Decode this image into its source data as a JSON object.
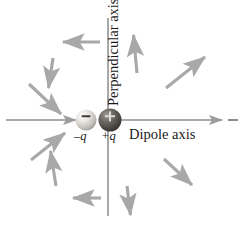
{
  "figure": {
    "width": 241,
    "height": 230,
    "background": "#ffffff"
  },
  "labels": {
    "dipole_axis": "Dipole axis",
    "perpendicular_axis": "Perpendicular axis",
    "negative_charge": "–q",
    "positive_charge": "+q",
    "negative_sign_glyph": "–",
    "positive_sign_glyph": "+"
  },
  "colors": {
    "axis_line": "#8c8c8c",
    "arrow": "#a8a8a8",
    "text": "#1a1a1a",
    "negative_sphere_light": "#f2f0ee",
    "negative_sphere_mid": "#c9c5c1",
    "negative_sphere_dark": "#9a9590",
    "positive_sphere_light": "#8d8983",
    "positive_sphere_mid": "#5c5853",
    "positive_sphere_dark": "#3a3733",
    "sign_on_sphere": "#2b2b2b"
  },
  "charges": [
    {
      "name": "negative-charge",
      "sign": "–",
      "label": "–q",
      "cx": 86,
      "cy": 120,
      "r": 10.5,
      "shade": "light"
    },
    {
      "name": "positive-charge",
      "sign": "+",
      "label": "+q",
      "cx": 110,
      "cy": 120,
      "r": 11.5,
      "shade": "dark"
    }
  ],
  "axes": [
    {
      "name": "dipole-axis",
      "orientation": "horizontal",
      "x1": 6,
      "y1": 120,
      "x2": 236,
      "y2": 120,
      "arrow_right_at_x": 218,
      "arrow_right_toward_center_at_x": 72
    },
    {
      "name": "perpendicular-axis",
      "orientation": "vertical",
      "x1": 108,
      "y1": 18,
      "x2": 108,
      "y2": 216
    }
  ],
  "field_arrows": [
    {
      "name": "field-arrow-upper-left-horizontal",
      "x1": 100,
      "y1": 42,
      "x2": 61,
      "y2": 42,
      "direction": "left"
    },
    {
      "name": "field-arrow-upper-left-down",
      "x1": 53,
      "y1": 58,
      "x2": 48,
      "y2": 91,
      "direction": "down"
    },
    {
      "name": "field-arrow-upper-left-diagonal-inner",
      "x1": 29,
      "y1": 84,
      "x2": 64,
      "y2": 117,
      "direction": "down-right"
    },
    {
      "name": "field-arrow-upper-right-vertical",
      "x1": 137,
      "y1": 73,
      "x2": 133,
      "y2": 32,
      "direction": "up"
    },
    {
      "name": "field-arrow-upper-right-diagonal",
      "x1": 166,
      "y1": 88,
      "x2": 208,
      "y2": 54,
      "direction": "up-right"
    },
    {
      "name": "field-arrow-lower-left-diagonal-outer",
      "x1": 31,
      "y1": 160,
      "x2": 68,
      "y2": 130,
      "direction": "up-right"
    },
    {
      "name": "field-arrow-lower-left-vertical",
      "x1": 56,
      "y1": 186,
      "x2": 50,
      "y2": 148,
      "direction": "up"
    },
    {
      "name": "field-arrow-lower-left-horizontal",
      "x1": 101,
      "y1": 198,
      "x2": 71,
      "y2": 198,
      "direction": "left"
    },
    {
      "name": "field-arrow-lower-right-near",
      "x1": 127,
      "y1": 186,
      "x2": 131,
      "y2": 218,
      "direction": "down"
    },
    {
      "name": "field-arrow-lower-right-diagonal",
      "x1": 164,
      "y1": 159,
      "x2": 195,
      "y2": 188,
      "direction": "down-right"
    }
  ]
}
